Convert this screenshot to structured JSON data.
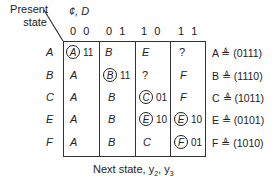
{
  "header": {
    "present_state_line1": "Present",
    "present_state_line2": "state",
    "input_vars": "¢, D",
    "columns": [
      "0 0",
      "0 1",
      "1 0",
      "1 1"
    ]
  },
  "rows": [
    {
      "state": "A",
      "cells": [
        {
          "next": "A",
          "stable": true,
          "output": "11"
        },
        {
          "next": "B",
          "stable": false,
          "output": ""
        },
        {
          "next": "E",
          "stable": false,
          "output": ""
        },
        {
          "next": "?",
          "stable": false,
          "output": ""
        }
      ],
      "assignment": "A ≜ (0111)"
    },
    {
      "state": "B",
      "cells": [
        {
          "next": "A",
          "stable": false,
          "output": ""
        },
        {
          "next": "B",
          "stable": true,
          "output": "11"
        },
        {
          "next": "?",
          "stable": false,
          "output": ""
        },
        {
          "next": "F",
          "stable": false,
          "output": ""
        }
      ],
      "assignment": "B ≜ (1110)"
    },
    {
      "state": "C",
      "cells": [
        {
          "next": "A",
          "stable": false,
          "output": ""
        },
        {
          "next": "B",
          "stable": false,
          "output": ""
        },
        {
          "next": "C",
          "stable": true,
          "output": "01"
        },
        {
          "next": "F",
          "stable": false,
          "output": ""
        }
      ],
      "assignment": "C ≜ (1011)"
    },
    {
      "state": "E",
      "cells": [
        {
          "next": "A",
          "stable": false,
          "output": ""
        },
        {
          "next": "B",
          "stable": false,
          "output": ""
        },
        {
          "next": "E",
          "stable": true,
          "output": "10"
        },
        {
          "next": "E",
          "stable": true,
          "output": "10"
        }
      ],
      "assignment": "E ≜ (0101)"
    },
    {
      "state": "F",
      "cells": [
        {
          "next": "A",
          "stable": false,
          "output": ""
        },
        {
          "next": "B",
          "stable": false,
          "output": ""
        },
        {
          "next": "C",
          "stable": false,
          "output": ""
        },
        {
          "next": "F",
          "stable": true,
          "output": "01"
        }
      ],
      "assignment": "F ≜ (1010)"
    }
  ],
  "footer": {
    "caption": "Next state, y",
    "sub2": "2",
    "sep": ", y",
    "sub3": "3"
  }
}
